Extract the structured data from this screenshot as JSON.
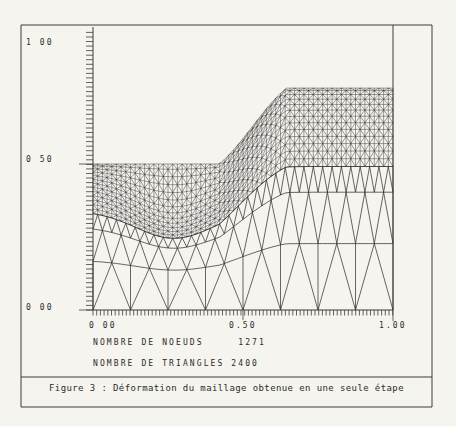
{
  "figure": {
    "caption": "Figure 3 : Déformation du maillage obtenue en une seule étape",
    "stats": {
      "nodes_line": "NOMBRE DE NOEUDS     1271",
      "triangles_line": "NOMBRE DE TRIANGLES 2400"
    }
  },
  "axes": {
    "y_labels": [
      {
        "label": "1 00",
        "value": 1.0
      },
      {
        "label": "0 50",
        "value": 0.5
      },
      {
        "label": "0 00",
        "value": 0.0
      }
    ],
    "x_labels": [
      {
        "label": "0 00",
        "value": 0.0
      },
      {
        "label": "0.50",
        "value": 0.5
      },
      {
        "label": "1.00",
        "value": 1.0
      }
    ]
  },
  "chart_data": {
    "type": "other",
    "subtype": "finite-element-triangular-mesh",
    "title": "",
    "xlabel": "",
    "ylabel": "",
    "xlim": [
      0,
      1
    ],
    "ylim": [
      0,
      1
    ],
    "x_ticks_labeled": [
      0,
      0.5,
      1.0
    ],
    "y_ticks_labeled": [
      0,
      0.5,
      1.0
    ],
    "node_count": 1271,
    "triangle_count": 2400,
    "surface_profile": [
      [
        0,
        0.5
      ],
      [
        0.42,
        0.5
      ],
      [
        0.645,
        0.76
      ],
      [
        1.0,
        0.76
      ]
    ],
    "mesh": {
      "depth_total": 0.5,
      "ramp_x0": 0.42,
      "ramp_x1": 0.645,
      "y_left": 0.5,
      "y_right": 0.76,
      "lift_power": 1.4,
      "dip": {
        "amplitude": 0.12,
        "center_x": 0.27,
        "sigma_x": 0.18,
        "peak_depth": 0.12
      },
      "fine_band": {
        "cols": 64,
        "rows": 13,
        "d_top": 0.0,
        "d_bottom": 0.16,
        "grade": 1.35
      },
      "strips": [
        {
          "style": "transition",
          "cols_bottom": 8,
          "cols_top": 16,
          "d_bottom": 0.5,
          "d_top": 0.33
        },
        {
          "style": "zigzag",
          "cols": 16,
          "d_bottom": 0.33,
          "d_top": 0.215
        },
        {
          "style": "zigzag",
          "cols": 32,
          "d_bottom": 0.215,
          "d_top": 0.16
        }
      ]
    },
    "line_color": "#262626",
    "frame_color": "#3c3c3c"
  }
}
